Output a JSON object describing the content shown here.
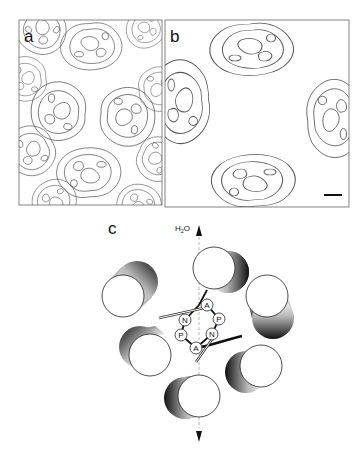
{
  "figure": {
    "panels": [
      {
        "id": "a",
        "label": "a",
        "type": "projection-density-map",
        "frame": {
          "x": 19,
          "y": 20,
          "w": 143,
          "h": 185
        }
      },
      {
        "id": "b",
        "label": "b",
        "type": "projection-density-map",
        "frame": {
          "x": 165,
          "y": 20,
          "w": 184,
          "h": 187
        },
        "scale_bar": {
          "x1": 324,
          "x2": 342,
          "y": 195
        }
      },
      {
        "id": "c",
        "label": "c",
        "type": "helix-bundle-schematic"
      }
    ],
    "panel_c": {
      "axis_label": "H2O",
      "axis_label_main": "H",
      "axis_label_sub": "2",
      "axis_label_tail": "O",
      "residues": [
        {
          "letter": "A",
          "x": 207,
          "y": 305
        },
        {
          "letter": "P",
          "x": 219,
          "y": 319
        },
        {
          "letter": "N",
          "x": 212,
          "y": 334
        },
        {
          "letter": "A",
          "x": 196,
          "y": 348
        },
        {
          "letter": "P",
          "x": 181,
          "y": 335
        },
        {
          "letter": "N",
          "x": 185,
          "y": 320
        }
      ],
      "helices": [
        {
          "name": "top",
          "cx": 214,
          "cy": 268,
          "shadow_dx": 14,
          "shadow_dy": 4
        },
        {
          "name": "upper-left",
          "cx": 123,
          "cy": 296,
          "shadow_dx": 14,
          "shadow_dy": -14
        },
        {
          "name": "right",
          "cx": 267,
          "cy": 296,
          "shadow_dx": 6,
          "shadow_dy": 22
        },
        {
          "name": "left",
          "cx": 150,
          "cy": 355,
          "shadow_dx": -10,
          "shadow_dy": -8
        },
        {
          "name": "lower-right",
          "cx": 261,
          "cy": 366,
          "shadow_dx": -15,
          "shadow_dy": 6
        },
        {
          "name": "bottom",
          "cx": 199,
          "cy": 396,
          "shadow_dx": -14,
          "shadow_dy": 2
        }
      ]
    }
  }
}
